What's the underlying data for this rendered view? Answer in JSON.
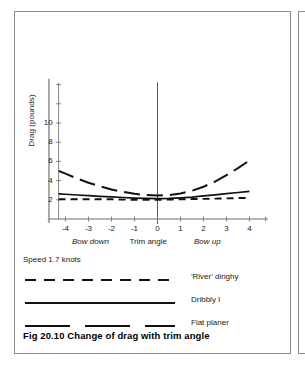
{
  "figure": {
    "caption": "Fig 20.10 Change of drag with trim angle",
    "speed_note": "Speed 1.7 knots"
  },
  "legend": {
    "items": [
      {
        "label": "'River' dinghy",
        "style": "dashed",
        "swatch_name": "legend-swatch-river-dinghy"
      },
      {
        "label": "Dribbly I",
        "style": "solid",
        "swatch_name": "legend-swatch-dribbly-i"
      },
      {
        "label": "Flat planer",
        "style": "long-dashed",
        "swatch_name": "legend-swatch-flat-planer"
      }
    ]
  },
  "axis_text": {
    "ylabel": "Drag  (pounds)",
    "zone_left": "Bow down",
    "zone_center": "Trim angle",
    "zone_right": "Bow up",
    "y_ticks": [
      "2",
      "4",
      "6",
      "8",
      "10"
    ],
    "x_ticks": [
      "-4",
      "-3",
      "-2",
      "-1",
      "0",
      "1",
      "2",
      "3",
      "4"
    ]
  },
  "chart_data": {
    "type": "line",
    "title": "Fig 20.10 Change of drag with trim angle",
    "subtitle": "Speed 1.7 knots",
    "xlabel": "Trim angle",
    "ylabel": "Drag (pounds)",
    "xlim": [
      -4.6,
      4.8
    ],
    "ylim": [
      0,
      15
    ],
    "xticks": [
      -4,
      -3,
      -2,
      -1,
      0,
      1,
      2,
      3,
      4
    ],
    "yticks": [
      2,
      4,
      6,
      8,
      10
    ],
    "ytick_labels": [
      "2",
      "4",
      "6",
      "8",
      "10"
    ],
    "grid": false,
    "legend_position": "below-plot",
    "annotations": [
      {
        "text": "Bow down",
        "x": -2.5,
        "italic": true
      },
      {
        "text": "Trim angle",
        "x": 0,
        "italic": false
      },
      {
        "text": "Bow up",
        "x": 2.8,
        "italic": true
      }
    ],
    "x": [
      -4.3,
      -4.0,
      -3.5,
      -3.0,
      -2.5,
      -2.0,
      -1.5,
      -1.0,
      -0.5,
      0.0,
      0.5,
      1.0,
      1.5,
      2.0,
      2.5,
      3.0,
      3.5,
      4.0
    ],
    "series": [
      {
        "name": "'River' dinghy",
        "style": "dashed",
        "color": "#111111",
        "values": [
          2.05,
          2.05,
          2.05,
          2.05,
          2.05,
          2.05,
          2.02,
          2.0,
          2.0,
          2.0,
          2.02,
          2.05,
          2.08,
          2.1,
          2.12,
          2.15,
          2.18,
          2.2
        ]
      },
      {
        "name": "Dribbly I",
        "style": "solid",
        "color": "#111111",
        "values": [
          2.62,
          2.58,
          2.5,
          2.43,
          2.36,
          2.3,
          2.24,
          2.18,
          2.14,
          2.12,
          2.14,
          2.2,
          2.28,
          2.4,
          2.52,
          2.64,
          2.76,
          2.88
        ]
      },
      {
        "name": "Flat planer",
        "style": "long-dashed",
        "color": "#111111",
        "values": [
          5.02,
          4.72,
          4.22,
          3.78,
          3.4,
          3.08,
          2.82,
          2.62,
          2.5,
          2.44,
          2.5,
          2.66,
          2.94,
          3.36,
          3.9,
          4.56,
          5.3,
          6.1
        ]
      }
    ]
  }
}
